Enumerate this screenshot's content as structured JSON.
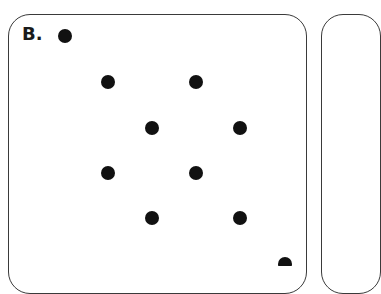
{
  "figure": {
    "panel_label": "B.",
    "dot_color": "#111111",
    "border_color": "#3a3a3a",
    "dot_radius": 7,
    "dots": [
      {
        "x": 65,
        "y": 36
      },
      {
        "x": 108,
        "y": 82
      },
      {
        "x": 196,
        "y": 82
      },
      {
        "x": 152,
        "y": 128
      },
      {
        "x": 240,
        "y": 128
      },
      {
        "x": 108,
        "y": 173
      },
      {
        "x": 196,
        "y": 173
      },
      {
        "x": 152,
        "y": 218
      },
      {
        "x": 240,
        "y": 218
      },
      {
        "x": 285,
        "y": 264
      }
    ]
  }
}
